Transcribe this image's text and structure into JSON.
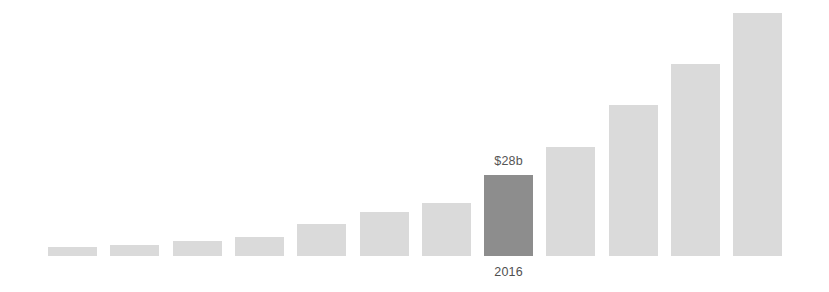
{
  "chart_data": {
    "type": "bar",
    "title": "",
    "subtitle": "",
    "xlabel": "",
    "ylabel": "",
    "unit": "$b",
    "grid": false,
    "legend": false,
    "legend_position": "none",
    "axis_visible": false,
    "tick_labels_visible": false,
    "ylim": [
      0,
      84
    ],
    "categories": [
      "1",
      "2",
      "3",
      "4",
      "5",
      "6",
      "7",
      "2016",
      "9",
      "10",
      "11",
      "12"
    ],
    "values": [
      3,
      4,
      5,
      7,
      11,
      15,
      18,
      28,
      38,
      52,
      66,
      84
    ],
    "bar_pixel_heights": [
      9,
      11,
      15,
      19,
      32,
      44,
      53,
      81,
      109,
      151,
      192,
      243
    ],
    "highlight_index": 7,
    "annotations": [
      {
        "index": 7,
        "value_label": "$28b",
        "category_label": "2016"
      }
    ],
    "colors": {
      "bar": "#dadada",
      "bar_highlight": "#8d8d8d",
      "value_label": "#555555",
      "category_label": "#4f4f4f",
      "background": "#ffffff"
    },
    "layout": {
      "baseline_y": 256,
      "first_bar_x": 48,
      "bar_width": 49,
      "bar_pitch": 62.3
    }
  }
}
